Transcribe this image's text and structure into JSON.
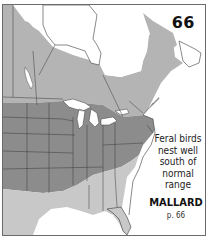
{
  "plate": {
    "number": "66"
  },
  "species": {
    "name": "MALLARD",
    "page_ref": "p. 66"
  },
  "note": {
    "lines": [
      "Feral birds",
      "nest well",
      "south of",
      "normal range"
    ]
  },
  "legend_colors": {
    "breeding_and_winter": "#8c8c8c",
    "breeding_only": "#b4b4b4",
    "winter_only": "#c8c8c8",
    "outside_range": "#ffffff",
    "water": "#ffffff",
    "borders": "#3a3a3a"
  }
}
